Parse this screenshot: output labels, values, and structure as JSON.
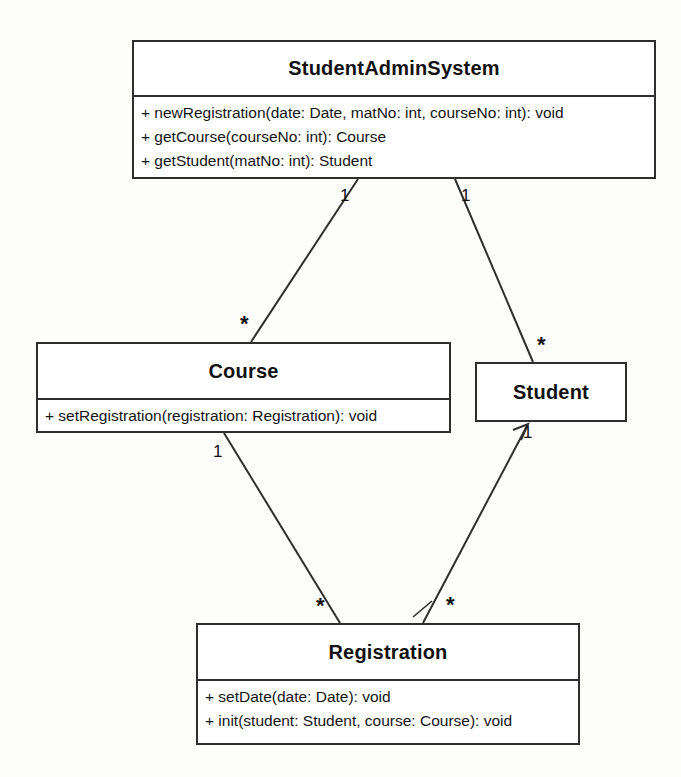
{
  "diagram": {
    "type": "uml-class-diagram",
    "stroke_color": "#2e2e2e",
    "background_color": "#fdfdfc",
    "classes": [
      {
        "id": "studentadminsystem",
        "name": "StudentAdminSystem",
        "attributes": [],
        "operations": [
          "+ newRegistration(date: Date, matNo: int, courseNo: int): void",
          "+ getCourse(courseNo: int): Course",
          "+ getStudent(matNo: int): Student"
        ]
      },
      {
        "id": "course",
        "name": "Course",
        "attributes": [],
        "operations": [
          "+ setRegistration(registration: Registration): void"
        ]
      },
      {
        "id": "student",
        "name": "Student",
        "attributes": [],
        "operations": []
      },
      {
        "id": "registration",
        "name": "Registration",
        "attributes": [],
        "operations": [
          "+ setDate(date: Date): void",
          "+ init(student: Student, course: Course): void"
        ]
      }
    ],
    "associations": [
      {
        "id": "sas-course",
        "from": "StudentAdminSystem",
        "to": "Course",
        "from_multiplicity": "1",
        "to_multiplicity": "*",
        "arrow": "none"
      },
      {
        "id": "sas-student",
        "from": "StudentAdminSystem",
        "to": "Student",
        "from_multiplicity": "1",
        "to_multiplicity": "*",
        "arrow": "none"
      },
      {
        "id": "course-registration",
        "from": "Course",
        "to": "Registration",
        "from_multiplicity": "1",
        "to_multiplicity": "*",
        "arrow": "none"
      },
      {
        "id": "registration-student",
        "from": "Registration",
        "to": "Student",
        "from_multiplicity": "*",
        "to_multiplicity": "1",
        "arrow": "open-arrow-to-student"
      }
    ]
  }
}
